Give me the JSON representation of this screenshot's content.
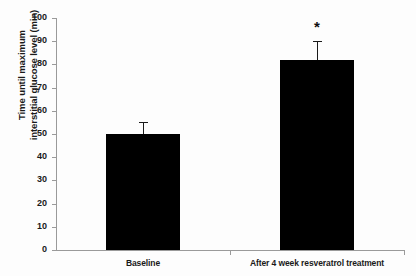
{
  "chart_data": {
    "type": "bar",
    "title": "",
    "subtitle": "",
    "xlabel": "",
    "ylabel_line1": "Time until maximum",
    "ylabel_line2": "interstitial glucose level (min)",
    "categories": [
      "Baseline",
      "After 4 week resveratrol treatment"
    ],
    "values": [
      50,
      82
    ],
    "errors": [
      5,
      8
    ],
    "error_type": "SEM",
    "ylim": [
      0,
      100
    ],
    "ytick_labels": [
      "0",
      "10",
      "20",
      "30",
      "40",
      "50",
      "60",
      "70",
      "80",
      "90",
      "100"
    ],
    "ytick_values": [
      0,
      10,
      20,
      30,
      40,
      50,
      60,
      70,
      80,
      90,
      100
    ],
    "grid": false,
    "legend": "none",
    "bar_color": "#000000",
    "axis_color": "#9a9a9a",
    "annotations": [
      {
        "text": "*",
        "category_index": 1,
        "meaning": "significant-difference"
      }
    ]
  }
}
